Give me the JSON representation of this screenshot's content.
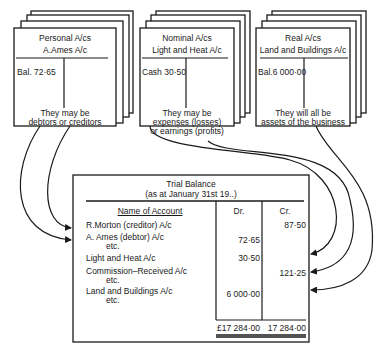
{
  "cards": [
    {
      "heading": "Personal A/cs",
      "account": "A.Ames A/c",
      "entry": "Bal. 72·65",
      "note_line1": "They may be",
      "note_line2": "debtors or creditors"
    },
    {
      "heading": "Nominal A/cs",
      "account": "Light and Heat A/c",
      "entry": "Cash 30·50",
      "note_line1": "They may be",
      "note_line2": "expenses (losses)",
      "note_line3": "or earnings (profits)"
    },
    {
      "heading": "Real A/cs",
      "account": "Land and Buildings A/c",
      "entry": "Bal.6 000·00",
      "note_line1": "They will all be",
      "note_line2": "assets of the business"
    }
  ],
  "trial_balance": {
    "title": "Trial Balance",
    "subtitle": "(as at January 31st 19..)",
    "columns": [
      "Name of Account",
      "Dr.",
      "Cr."
    ],
    "rows": [
      {
        "name": "R.Morton (creditor) A/c",
        "dr": "",
        "cr": "87·50"
      },
      {
        "name": "A. Ames (debtor) A/c",
        "sub": "etc.",
        "dr": "72·65",
        "cr": ""
      },
      {
        "name": "Light and Heat A/c",
        "dr": "30·50",
        "cr": ""
      },
      {
        "name": "Commission–Received A/c",
        "sub": "etc.",
        "dr": "",
        "cr": "121·25"
      },
      {
        "name": "Land and Buildings A/c",
        "sub": "etc.",
        "dr": "6 000·00",
        "cr": ""
      }
    ],
    "totals": {
      "dr": "£17 284·00",
      "cr": "17 284·00"
    }
  }
}
